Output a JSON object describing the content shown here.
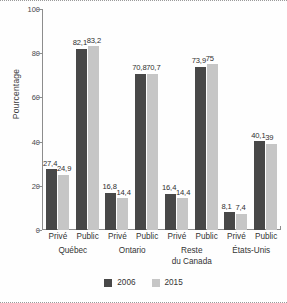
{
  "chart_data": {
    "type": "bar",
    "title": "",
    "xlabel": "",
    "ylabel": "Pourcentage",
    "ylim": [
      0,
      100
    ],
    "yticks": [
      0,
      20,
      40,
      60,
      80,
      100
    ],
    "ytick_labels": [
      "0",
      "20",
      "40",
      "60",
      "80",
      "100"
    ],
    "grid": false,
    "legend_position": "bottom-center",
    "categories": [
      "Privé Québec",
      "Public Québec",
      "Privé Ontario",
      "Public Ontario",
      "Privé Reste du Canada",
      "Public Reste du Canada",
      "Privé États-Unis",
      "Public États-Unis"
    ],
    "series": [
      {
        "name": "2006",
        "color": "#484848",
        "values": [
          27.4,
          82.1,
          16.8,
          70.8,
          16.4,
          73.9,
          8.1,
          40.1
        ],
        "labels": [
          "27,4",
          "82,1",
          "16,8",
          "70,8",
          "16,4",
          "73,9",
          "8,1",
          "40,1"
        ]
      },
      {
        "name": "2015",
        "color": "#c6c6c6",
        "values": [
          24.9,
          83.2,
          14.4,
          70.7,
          14.4,
          75.0,
          7.4,
          39.0
        ],
        "labels": [
          "24,9",
          "83,2",
          "14,4",
          "70,7",
          "14,4",
          "75",
          "7,4",
          "39"
        ]
      }
    ],
    "groups": [
      {
        "name": "Québec",
        "lines": [
          "Québec"
        ]
      },
      {
        "name": "Ontario",
        "lines": [
          "Ontario"
        ]
      },
      {
        "name": "Reste du Canada",
        "lines": [
          "Reste",
          "du Canada"
        ]
      },
      {
        "name": "États-Unis",
        "lines": [
          "États-Unis"
        ]
      }
    ],
    "sector_labels": [
      "Privé",
      "Public",
      "Privé",
      "Public",
      "Privé",
      "Public",
      "Privé",
      "Public"
    ],
    "legend": [
      {
        "label": "2006",
        "color": "#484848"
      },
      {
        "label": "2015",
        "color": "#c6c6c6"
      }
    ]
  }
}
